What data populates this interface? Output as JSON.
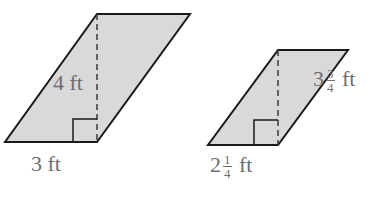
{
  "figures": [
    {
      "id": "large",
      "fill": "#d9d9d9",
      "stroke": "#1a1a1a",
      "height_label": "4 ft",
      "base_label": "3 ft"
    },
    {
      "id": "small",
      "fill": "#d9d9d9",
      "stroke": "#1a1a1a",
      "height_label": {
        "whole": "3",
        "num": "3",
        "den": "4",
        "unit": "ft"
      },
      "base_label": {
        "whole": "2",
        "num": "1",
        "den": "4",
        "unit": "ft"
      }
    }
  ]
}
